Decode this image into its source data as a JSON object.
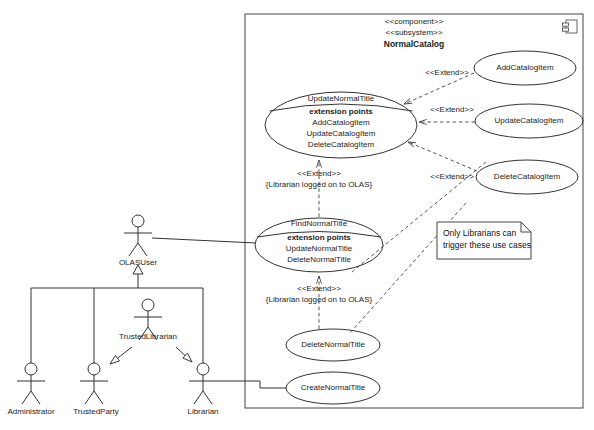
{
  "diagram": {
    "component": {
      "stereotype1": "<<component>>",
      "stereotype2": "<<subsystem>>",
      "name": "NormalCatalog",
      "icon": "component-icon"
    },
    "use_cases": [
      {
        "id": "update-normal-title",
        "name": "UpdateNormalTitle",
        "compartment_label": "extension points",
        "extension_points": [
          "AddCatalogItem",
          "UpdateCatalogItem",
          "DeleteCatalogItem"
        ]
      },
      {
        "id": "find-normal-title",
        "name": "FindNormalTitle",
        "compartment_label": "extension points",
        "extension_points": [
          "UpdateNormalTitle",
          "DeleteNormalTitle"
        ]
      },
      {
        "id": "add-catalog-item",
        "name": "AddCatalogItem",
        "extension_points": []
      },
      {
        "id": "update-catalog-item",
        "name": "UpdateCatalogItem",
        "extension_points": []
      },
      {
        "id": "delete-catalog-item",
        "name": "DeleteCatalogItem",
        "extension_points": []
      },
      {
        "id": "delete-normal-title",
        "name": "DeleteNormalTitle",
        "extension_points": []
      },
      {
        "id": "create-normal-title",
        "name": "CreateNormalTitle",
        "extension_points": []
      }
    ],
    "actors": [
      {
        "id": "olas-user",
        "name": "OLASUser"
      },
      {
        "id": "trusted-librarian",
        "name": "TrustedLibrarian"
      },
      {
        "id": "administrator",
        "name": "Administrator"
      },
      {
        "id": "trusted-party",
        "name": "TrustedParty"
      },
      {
        "id": "librarian",
        "name": "Librarian"
      }
    ],
    "relationships": [
      {
        "id": "extend-add-catalog-item",
        "stereotype": "<<Extend>>",
        "condition": ""
      },
      {
        "id": "extend-update-catalog-item",
        "stereotype": "<<Extend>>",
        "condition": ""
      },
      {
        "id": "extend-delete-catalog-item",
        "stereotype": "<<Extend>>",
        "condition": ""
      },
      {
        "id": "extend-update-normal-title",
        "stereotype": "<<Extend>>",
        "condition": "{Librarian logged on to OLAS}"
      },
      {
        "id": "extend-delete-normal-title",
        "stereotype": "<<Extend>>",
        "condition": "{Librarian logged on to OLAS}"
      }
    ],
    "note": {
      "id": "librarian-note",
      "line1": "Only Librarians can",
      "line2": "trigger these use cases"
    }
  }
}
